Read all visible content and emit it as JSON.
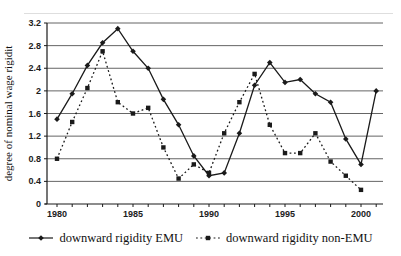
{
  "figure": {
    "background": "#ffffff",
    "ink_color": "#1a1a1a",
    "gridline_color": "#3d3d3d",
    "top_rule_color": "#dedede"
  },
  "chart_data": {
    "type": "line",
    "title": "",
    "xlabel": "",
    "ylabel": "degree of nominal wage rigidit",
    "ylim": [
      0,
      3.2
    ],
    "ytick_labels": [
      "0",
      "0.4",
      "0.8",
      "1.2",
      "1.6",
      "2",
      "2.4",
      "2.8",
      "3.2"
    ],
    "x": [
      1980,
      1981,
      1982,
      1983,
      1984,
      1985,
      1986,
      1987,
      1988,
      1989,
      1990,
      1991,
      1992,
      1993,
      1994,
      1995,
      1996,
      1997,
      1998,
      1999,
      2000,
      2001
    ],
    "xtick_labels": [
      "1980",
      "1985",
      "1990",
      "1995",
      "2000"
    ],
    "grid": "horizontal",
    "legend_position": "bottom",
    "series": [
      {
        "name": "downward rigidity EMU",
        "line_style": "solid",
        "marker": "diamond",
        "color": "#1a1a1a",
        "values": [
          1.5,
          1.95,
          2.45,
          2.85,
          3.1,
          2.7,
          2.4,
          1.85,
          1.4,
          0.85,
          0.5,
          0.55,
          1.25,
          2.1,
          2.5,
          2.15,
          2.2,
          1.95,
          1.8,
          1.15,
          0.7,
          2.0
        ]
      },
      {
        "name": "downward rigidity non-EMU",
        "line_style": "dotted",
        "marker": "square",
        "color": "#1a1a1a",
        "values": [
          0.8,
          1.45,
          2.05,
          2.7,
          1.8,
          1.6,
          1.7,
          1.0,
          0.45,
          0.7,
          0.55,
          1.25,
          1.8,
          2.3,
          1.4,
          0.9,
          0.9,
          1.25,
          0.75,
          0.5,
          0.25,
          null
        ]
      }
    ]
  }
}
